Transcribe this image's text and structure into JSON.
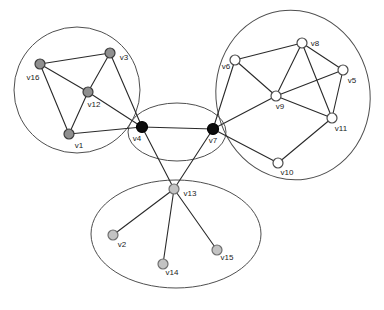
{
  "figure": {
    "kind": "undirected-graph-community-diagram",
    "width": 384,
    "height": 310,
    "background": "#ffffff"
  },
  "style": {
    "edge_color": "#2a2a2a",
    "edge_width": 1.1,
    "cluster_outline_color": "#4f4f4f",
    "cluster_outline_width": 1,
    "label_color": "#1b1b1b",
    "label_font_size": 8,
    "node_radius": 5,
    "hub_node_radius": 5.5,
    "node_stroke_width": 1.2
  },
  "node_styles": {
    "dark_gray": {
      "fill": "#8f8f8f",
      "stroke": "#3c3c3c"
    },
    "light_gray": {
      "fill": "#c3c3c3",
      "stroke": "#6f6f6f"
    },
    "white": {
      "fill": "#ffffff",
      "stroke": "#4b4b4b"
    },
    "black": {
      "fill": "#0d0d0d",
      "stroke": "#000000"
    }
  },
  "clusters": [
    {
      "name": "left-circle",
      "cx": 77,
      "cy": 90,
      "rx": 63,
      "ry": 63,
      "rotation": 0
    },
    {
      "name": "right-ellipse",
      "cx": 293,
      "cy": 95,
      "rx": 77,
      "ry": 85,
      "rotation": -9
    },
    {
      "name": "middle-ellipse",
      "cx": 177,
      "cy": 132,
      "rx": 49,
      "ry": 29,
      "rotation": 0
    },
    {
      "name": "bottom-ellipse",
      "cx": 176,
      "cy": 234,
      "rx": 85,
      "ry": 54,
      "rotation": 0
    }
  ],
  "nodes": [
    {
      "id": "v1",
      "label": "v1",
      "x": 69,
      "y": 134,
      "style": "dark_gray",
      "label_x": 79,
      "label_y": 148
    },
    {
      "id": "v2",
      "label": "v2",
      "x": 113,
      "y": 235,
      "style": "light_gray",
      "label_x": 122,
      "label_y": 247
    },
    {
      "id": "v3",
      "label": "v3",
      "x": 110,
      "y": 53,
      "style": "dark_gray",
      "label_x": 124,
      "label_y": 60
    },
    {
      "id": "v4",
      "label": "v4",
      "x": 142,
      "y": 127,
      "style": "black",
      "label_x": 137,
      "label_y": 141
    },
    {
      "id": "v5",
      "label": "v5",
      "x": 343,
      "y": 70,
      "style": "white",
      "label_x": 352,
      "label_y": 83
    },
    {
      "id": "v6",
      "label": "v6",
      "x": 235,
      "y": 60,
      "style": "white",
      "label_x": 226,
      "label_y": 69
    },
    {
      "id": "v7",
      "label": "v7",
      "x": 213,
      "y": 129,
      "style": "black",
      "label_x": 213,
      "label_y": 143
    },
    {
      "id": "v8",
      "label": "v8",
      "x": 302,
      "y": 43,
      "style": "white",
      "label_x": 315,
      "label_y": 46
    },
    {
      "id": "v9",
      "label": "v9",
      "x": 276,
      "y": 96,
      "style": "white",
      "label_x": 280,
      "label_y": 109
    },
    {
      "id": "v10",
      "label": "v10",
      "x": 278,
      "y": 163,
      "style": "white",
      "label_x": 287,
      "label_y": 175
    },
    {
      "id": "v11",
      "label": "v11",
      "x": 332,
      "y": 118,
      "style": "white",
      "label_x": 341,
      "label_y": 131
    },
    {
      "id": "v12",
      "label": "v12",
      "x": 88,
      "y": 92,
      "style": "dark_gray",
      "label_x": 94,
      "label_y": 107
    },
    {
      "id": "v13",
      "label": "v13",
      "x": 174,
      "y": 189,
      "style": "light_gray",
      "label_x": 190,
      "label_y": 196
    },
    {
      "id": "v14",
      "label": "v14",
      "x": 163,
      "y": 264,
      "style": "light_gray",
      "label_x": 172,
      "label_y": 275
    },
    {
      "id": "v15",
      "label": "v15",
      "x": 217,
      "y": 250,
      "style": "light_gray",
      "label_x": 227,
      "label_y": 260
    },
    {
      "id": "v16",
      "label": "v16",
      "x": 40,
      "y": 64,
      "style": "dark_gray",
      "label_x": 33,
      "label_y": 80
    }
  ],
  "edges": [
    [
      "v16",
      "v3"
    ],
    [
      "v16",
      "v12"
    ],
    [
      "v16",
      "v1"
    ],
    [
      "v3",
      "v12"
    ],
    [
      "v3",
      "v4"
    ],
    [
      "v12",
      "v1"
    ],
    [
      "v12",
      "v4"
    ],
    [
      "v1",
      "v4"
    ],
    [
      "v4",
      "v7"
    ],
    [
      "v4",
      "v13"
    ],
    [
      "v7",
      "v13"
    ],
    [
      "v13",
      "v2"
    ],
    [
      "v13",
      "v14"
    ],
    [
      "v13",
      "v15"
    ],
    [
      "v6",
      "v8"
    ],
    [
      "v6",
      "v9"
    ],
    [
      "v6",
      "v7"
    ],
    [
      "v8",
      "v9"
    ],
    [
      "v8",
      "v5"
    ],
    [
      "v8",
      "v11"
    ],
    [
      "v9",
      "v5"
    ],
    [
      "v9",
      "v11"
    ],
    [
      "v9",
      "v7"
    ],
    [
      "v5",
      "v11"
    ],
    [
      "v11",
      "v10"
    ],
    [
      "v7",
      "v10"
    ]
  ]
}
